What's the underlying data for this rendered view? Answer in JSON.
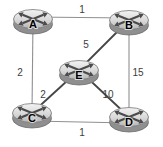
{
  "figure": {
    "name": "network-topology",
    "background": "#ffffff",
    "canvas": {
      "width": 163,
      "height": 147
    }
  },
  "diagram": {
    "type": "weighted-graph",
    "style": {
      "router_top_light": "#f2f2f2",
      "router_top_mid": "#d8d8d8",
      "router_top_dark": "#b5b5b5",
      "router_rim": "#8f8f8f",
      "router_rim_stroke": "#6e6e6e",
      "router_top_stroke": "#7a7a7a",
      "router_cross": "#4a4a4a",
      "node_label_color": "#000000",
      "weight_color": "#3d3d3d",
      "edge_thin_color": "#909090",
      "edge_thick_color": "#454545"
    },
    "nodes": [
      {
        "id": "A",
        "label": "A",
        "x": 33,
        "y": 19
      },
      {
        "id": "B",
        "label": "B",
        "x": 129,
        "y": 20
      },
      {
        "id": "E",
        "label": "E",
        "x": 79,
        "y": 70
      },
      {
        "id": "C",
        "label": "C",
        "x": 32,
        "y": 113
      },
      {
        "id": "D",
        "label": "D",
        "x": 129,
        "y": 117
      }
    ],
    "edges": [
      {
        "from": "A",
        "to": "B",
        "weight": "1",
        "label_x": 82,
        "label_y": 13,
        "color": "#909090",
        "width": 1.1,
        "dy1": -2,
        "dy2": -2
      },
      {
        "from": "A",
        "to": "C",
        "weight": "2",
        "label_x": 20,
        "label_y": 76,
        "color": "#909090",
        "width": 1.1,
        "dy1": 0,
        "dy2": 0
      },
      {
        "from": "B",
        "to": "E",
        "weight": "5",
        "label_x": 86,
        "label_y": 48,
        "color": "#454545",
        "width": 1.8,
        "dy1": 0,
        "dy2": 0
      },
      {
        "from": "B",
        "to": "D",
        "weight": "15",
        "label_x": 138,
        "label_y": 76,
        "color": "#909090",
        "width": 1.1,
        "dy1": 0,
        "dy2": 0
      },
      {
        "from": "C",
        "to": "E",
        "weight": "2",
        "label_x": 43,
        "label_y": 98,
        "color": "#454545",
        "width": 1.8,
        "dy1": 0,
        "dy2": 0
      },
      {
        "from": "E",
        "to": "D",
        "weight": "10",
        "label_x": 108,
        "label_y": 98,
        "color": "#454545",
        "width": 1.8,
        "dy1": 0,
        "dy2": 0
      },
      {
        "from": "C",
        "to": "D",
        "weight": "1",
        "label_x": 82,
        "label_y": 136,
        "color": "#909090",
        "width": 1.1,
        "dy1": 8,
        "dy2": 6
      }
    ]
  }
}
